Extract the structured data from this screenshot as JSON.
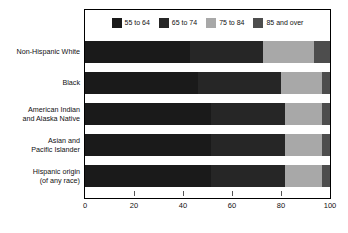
{
  "chart_data": {
    "type": "bar",
    "orientation": "horizontal",
    "stacked": true,
    "title": "",
    "subtitle": "",
    "xlabel": "",
    "ylabel": "",
    "xlim": [
      0,
      100
    ],
    "xticks": [
      0,
      20,
      40,
      60,
      80,
      100
    ],
    "xtick_labels": [
      "0",
      "20",
      "40",
      "60",
      "80",
      "100"
    ],
    "grid": false,
    "legend_position": "top-center",
    "categories": [
      "Non-Hispanic White",
      "Black",
      "American Indian and Alaska Native",
      "Asian and Pacific Islander",
      "Hispanic origin (of any race)"
    ],
    "series": [
      {
        "name": "55 to 64",
        "color": "#1a1a1a",
        "values": [
          43.0,
          46.0,
          51.5,
          51.5,
          51.5
        ]
      },
      {
        "name": "65 to 74",
        "color": "#262626",
        "values": [
          29.5,
          34.0,
          30.0,
          30.0,
          30.0
        ]
      },
      {
        "name": "75 to 84",
        "color": "#a8a8a8",
        "values": [
          21.0,
          16.7,
          15.2,
          15.2,
          15.2
        ]
      },
      {
        "name": "85 and over",
        "color": "#4d4d4d",
        "values": [
          6.5,
          3.3,
          3.3,
          3.3,
          3.3
        ]
      }
    ]
  },
  "legend": {
    "items": [
      {
        "label": "55 to 64",
        "color": "#1a1a1a"
      },
      {
        "label": "65 to 74",
        "color": "#262626"
      },
      {
        "label": "75 to 84",
        "color": "#a8a8a8"
      },
      {
        "label": "85 and over",
        "color": "#4d4d4d"
      }
    ]
  },
  "y_axis": {
    "category_labels": [
      {
        "lines": [
          "Non-Hispanic White"
        ]
      },
      {
        "lines": [
          "Black"
        ]
      },
      {
        "lines": [
          "American Indian",
          "and Alaska Native"
        ]
      },
      {
        "lines": [
          "Asian and",
          "Pacific Islander"
        ]
      },
      {
        "lines": [
          "Hispanic origin",
          "(of any race)"
        ]
      }
    ]
  },
  "x_axis": {
    "tick_labels": [
      "0",
      "20",
      "40",
      "60",
      "80",
      "100"
    ]
  },
  "colors": {
    "frame": "#000000",
    "background": "#ffffff",
    "text": "#111111"
  }
}
